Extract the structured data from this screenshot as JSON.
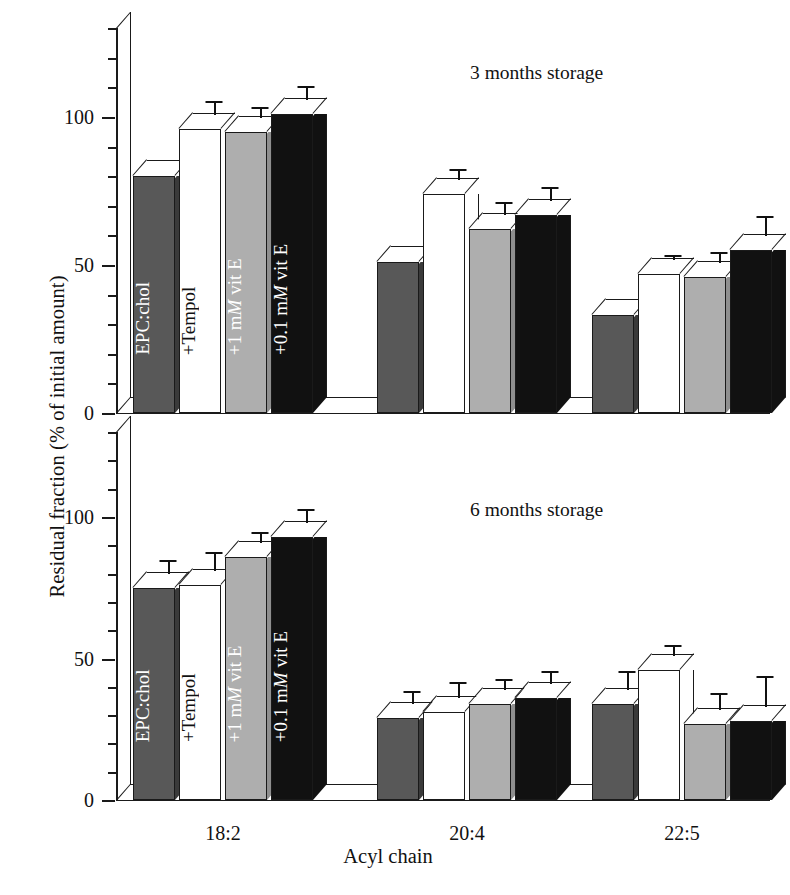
{
  "figure": {
    "ylabel": "Residual fraction (% of initial amount)",
    "xlabel": "Acyl chain"
  },
  "axis": {
    "tick_labels": [
      "0",
      "50",
      "100"
    ],
    "tick_values": [
      0,
      50,
      100
    ],
    "minor_step": 10,
    "ymin": 0,
    "ymax": 130
  },
  "categories": [
    "18:2",
    "20:4",
    "22:5"
  ],
  "series_labels": [
    "EPC:chol",
    "+Tempol",
    "+1 mM vit E",
    "+0.1 mM vit E"
  ],
  "series_label_parts": [
    {
      "pre": "EPC:chol",
      "it": "",
      "post": ""
    },
    {
      "pre": "+Tempol",
      "it": "",
      "post": ""
    },
    {
      "pre": "+1 m",
      "it": "M",
      "post": " vit E"
    },
    {
      "pre": "+0.1 m",
      "it": "M",
      "post": " vit E"
    }
  ],
  "colors": {
    "dark_gray": "#585858",
    "white": "#ffffff",
    "light_gray": "#aeaeae",
    "black": "#111111",
    "line": "#1a1a1a"
  },
  "panels": [
    {
      "id": "top",
      "title": "3 months storage"
    },
    {
      "id": "bottom",
      "title": "6 months storage"
    }
  ],
  "chart_data": {
    "type": "bar",
    "title": "",
    "xlabel": "Acyl chain",
    "ylabel": "Residual fraction (% of initial amount)",
    "ylim": [
      0,
      130
    ],
    "yticks": [
      0,
      50,
      100
    ],
    "grid": false,
    "legend": "in-bar vertical labels",
    "categories": [
      "18:2",
      "20:4",
      "22:5"
    ],
    "panels": [
      {
        "name": "3 months storage",
        "series": [
          {
            "name": "EPC:chol",
            "values": [
              80,
              51,
              33
            ],
            "errors": [
              0,
              0,
              0
            ]
          },
          {
            "name": "+Tempol",
            "values": [
              96,
              74,
              47
            ],
            "errors": [
              4,
              3,
              1
            ]
          },
          {
            "name": "+1 mM vit E",
            "values": [
              95,
              62,
              46
            ],
            "errors": [
              3,
              4,
              3
            ]
          },
          {
            "name": "+0.1 mM vit E",
            "values": [
              101,
              67,
              55
            ],
            "errors": [
              4,
              4,
              6
            ]
          }
        ]
      },
      {
        "name": "6 months storage",
        "series": [
          {
            "name": "EPC:chol",
            "values": [
              75,
              29,
              34
            ],
            "errors": [
              4,
              4,
              6
            ]
          },
          {
            "name": "+Tempol",
            "values": [
              76,
              31,
              46
            ],
            "errors": [
              6,
              5,
              3
            ]
          },
          {
            "name": "+1 mM vit E",
            "values": [
              86,
              34,
              27
            ],
            "errors": [
              3,
              3,
              5
            ]
          },
          {
            "name": "+0.1 mM vit E",
            "values": [
              93,
              36,
              28
            ],
            "errors": [
              4,
              4,
              10
            ]
          }
        ]
      }
    ]
  }
}
